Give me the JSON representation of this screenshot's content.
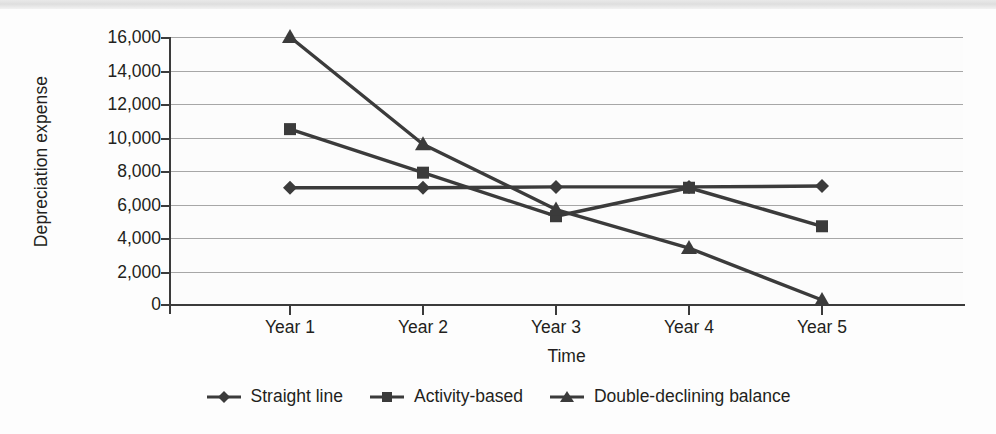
{
  "chart_data": {
    "type": "line",
    "title": "",
    "subtitle": "",
    "xlabel": "Time",
    "ylabel": "Depreciation expense",
    "categories": [
      "Year 1",
      "Year 2",
      "Year 3",
      "Year 4",
      "Year 5"
    ],
    "ylim": [
      0,
      16000
    ],
    "ytick_values": [
      0,
      2000,
      4000,
      6000,
      8000,
      10000,
      12000,
      14000,
      16000
    ],
    "ytick_labels": [
      "0",
      "2,000",
      "4,000",
      "6,000",
      "8,000",
      "10,000",
      "12,000",
      "14,000",
      "16,000"
    ],
    "grid": true,
    "grid_axis": "y",
    "legend_position": "bottom",
    "series": [
      {
        "name": "Straight line",
        "marker": "diamond",
        "color": "#3b3b3b",
        "values": [
          7000,
          7000,
          7050,
          7050,
          7100
        ]
      },
      {
        "name": "Activity-based",
        "marker": "square",
        "color": "#3b3b3b",
        "values": [
          10500,
          7900,
          5300,
          7000,
          4700
        ]
      },
      {
        "name": "Double-declining balance",
        "marker": "triangle",
        "color": "#3b3b3b",
        "values": [
          16000,
          9600,
          5700,
          3400,
          300
        ]
      }
    ]
  },
  "legend": {
    "items": [
      {
        "label": "Straight line",
        "marker": "diamond-marker-icon"
      },
      {
        "label": "Activity-based",
        "marker": "square-marker-icon"
      },
      {
        "label": "Double-declining balance",
        "marker": "triangle-marker-icon"
      }
    ]
  },
  "axes": {
    "y_title": "Depreciation expense",
    "x_title": "Time"
  },
  "colors": {
    "series": "#3b3b3b",
    "gridline": "#a7a7a7",
    "axis": "#3b3b3b",
    "text": "#231f20",
    "plot_background": "#fcfcfc",
    "page_background": "#ffffff"
  }
}
